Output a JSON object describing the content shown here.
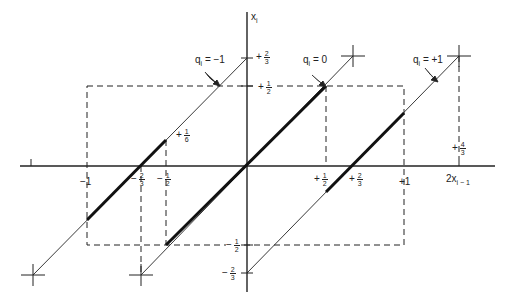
{
  "diagram": {
    "type": "quantizer-transfer-lines",
    "axes": {
      "x_label": "2x",
      "x_label_sub": "i − 1",
      "y_label": "x",
      "y_label_sub": "i"
    },
    "x_ticks": [
      {
        "sign": "−",
        "whole": "1",
        "value": -1
      },
      {
        "sign": "−",
        "num": "2",
        "den": "3",
        "value": -0.6667
      },
      {
        "sign": "−",
        "num": "1",
        "den": "2",
        "value": -0.5
      },
      {
        "sign": "+",
        "num": "1",
        "den": "2",
        "value": 0.5
      },
      {
        "sign": "+",
        "num": "2",
        "den": "3",
        "value": 0.6667
      },
      {
        "sign": "+",
        "whole": "1",
        "value": 1
      },
      {
        "sign": "+",
        "num": "4",
        "den": "3",
        "value": 1.3333
      }
    ],
    "y_ticks": [
      {
        "sign": "+",
        "num": "2",
        "den": "3",
        "value": 0.6667
      },
      {
        "sign": "+",
        "num": "1",
        "den": "2",
        "value": 0.5
      },
      {
        "sign": "+",
        "num": "1",
        "den": "6",
        "value": 0.1667
      },
      {
        "sign": "−",
        "num": "1",
        "den": "2",
        "value": -0.5
      },
      {
        "sign": "−",
        "num": "2",
        "den": "3",
        "value": -0.6667
      }
    ],
    "lines": [
      {
        "label_q": "q",
        "label_sub": "i",
        "label_rest": " = −1",
        "q": -1,
        "x_range": [
          -1.3333,
          0
        ],
        "thick_range": [
          -1,
          -0.5
        ]
      },
      {
        "label_q": "q",
        "label_sub": "i",
        "label_rest": " = 0",
        "q": 0,
        "x_range": [
          -0.6667,
          0.6667
        ],
        "thick_range": [
          -0.5,
          0.5
        ]
      },
      {
        "label_q": "q",
        "label_sub": "i",
        "label_rest": " = +1",
        "q": 1,
        "x_range": [
          0,
          1.3333
        ],
        "thick_range": [
          0.5,
          1
        ]
      }
    ],
    "dashed_box": {
      "x": [
        -1,
        1
      ],
      "y": [
        -0.5,
        0.5
      ]
    }
  }
}
